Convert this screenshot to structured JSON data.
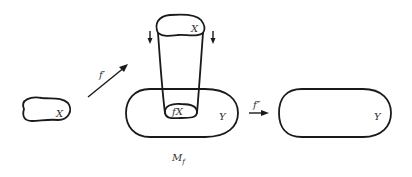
{
  "diagram": {
    "labels": {
      "x_small": "X",
      "f_prime": "f′",
      "x_top": "X",
      "fx": "fX",
      "y_left": "Y",
      "f_double_prime": "f″",
      "y_right": "Y",
      "mf": "M",
      "mf_sub": "f"
    },
    "colors": {
      "stroke": "#1a1a1a",
      "text": "#333333",
      "background": "#ffffff"
    }
  }
}
